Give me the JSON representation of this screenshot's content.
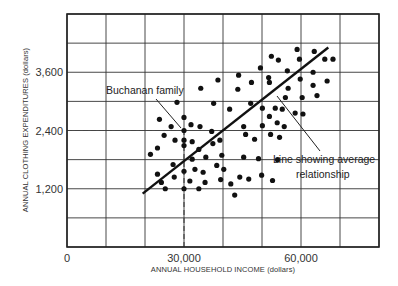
{
  "chart_data": {
    "type": "scatter",
    "title": "",
    "xlabel": "ANNUAL HOUSEHOLD INCOME (dollars)",
    "ylabel": "ANNUAL CLOTHING EXPENDITURES (dollars)",
    "xlim": [
      0,
      80000
    ],
    "ylim": [
      0,
      4800
    ],
    "grid": true,
    "x_gridlines": [
      0,
      10000,
      20000,
      30000,
      40000,
      50000,
      60000,
      70000,
      80000
    ],
    "y_gridlines": [
      0,
      600,
      1200,
      1800,
      2400,
      3000,
      3600,
      4200,
      4800
    ],
    "x_ticks": [
      {
        "value": 0,
        "label": "0"
      },
      {
        "value": 30000,
        "label": "30,000"
      },
      {
        "value": 60000,
        "label": "60,000"
      }
    ],
    "y_ticks": [
      {
        "value": 1200,
        "label": "1,200"
      },
      {
        "value": 2400,
        "label": "2,400"
      },
      {
        "value": 3600,
        "label": "3,600"
      }
    ],
    "series": [
      {
        "name": "Households",
        "points": [
          [
            59000,
            4070
          ],
          [
            63400,
            4030
          ],
          [
            52400,
            3930
          ],
          [
            54200,
            3850
          ],
          [
            59600,
            3870
          ],
          [
            66100,
            3870
          ],
          [
            68200,
            3870
          ],
          [
            49600,
            3690
          ],
          [
            56500,
            3630
          ],
          [
            63100,
            3600
          ],
          [
            44000,
            3540
          ],
          [
            51700,
            3490
          ],
          [
            38700,
            3440
          ],
          [
            47300,
            3390
          ],
          [
            51900,
            3390
          ],
          [
            59800,
            3460
          ],
          [
            66700,
            3420
          ],
          [
            34300,
            3270
          ],
          [
            43800,
            3250
          ],
          [
            56700,
            3270
          ],
          [
            63100,
            3330
          ],
          [
            64100,
            3120
          ],
          [
            56000,
            3080
          ],
          [
            60300,
            3080
          ],
          [
            37600,
            2960
          ],
          [
            47100,
            2960
          ],
          [
            41700,
            2840
          ],
          [
            50100,
            2860
          ],
          [
            53400,
            2860
          ],
          [
            55200,
            2840
          ],
          [
            58500,
            2760
          ],
          [
            60500,
            2740
          ],
          [
            51900,
            2690
          ],
          [
            53900,
            2560
          ],
          [
            55700,
            2480
          ],
          [
            45300,
            2480
          ],
          [
            50100,
            2500
          ],
          [
            34100,
            2480
          ],
          [
            45800,
            2320
          ],
          [
            52200,
            2320
          ],
          [
            54500,
            2260
          ],
          [
            37100,
            2380
          ],
          [
            39200,
            2200
          ],
          [
            48100,
            2220
          ],
          [
            28200,
            2980
          ],
          [
            30000,
            2670
          ],
          [
            23700,
            2630
          ],
          [
            31800,
            2520
          ],
          [
            26700,
            2480
          ],
          [
            30000,
            2400
          ],
          [
            24900,
            2300
          ],
          [
            27700,
            2200
          ],
          [
            30000,
            2090
          ],
          [
            32100,
            2170
          ],
          [
            23200,
            2040
          ],
          [
            30000,
            2200
          ],
          [
            33800,
            2010
          ],
          [
            37400,
            2130
          ],
          [
            32100,
            1810
          ],
          [
            27200,
            1700
          ],
          [
            30000,
            1560
          ],
          [
            32800,
            1600
          ],
          [
            34900,
            1540
          ],
          [
            38400,
            1680
          ],
          [
            40200,
            1600
          ],
          [
            23200,
            1500
          ],
          [
            24200,
            1330
          ],
          [
            27500,
            1440
          ],
          [
            31500,
            1360
          ],
          [
            35400,
            1330
          ],
          [
            39400,
            1390
          ],
          [
            44300,
            1440
          ],
          [
            30000,
            1200
          ],
          [
            33800,
            1200
          ],
          [
            25200,
            1200
          ],
          [
            21400,
            1910
          ],
          [
            39700,
            1890
          ],
          [
            35600,
            1850
          ],
          [
            45300,
            1850
          ],
          [
            42000,
            1300
          ],
          [
            43000,
            1070
          ],
          [
            46600,
            1400
          ],
          [
            49900,
            1480
          ],
          [
            52700,
            1370
          ],
          [
            54000,
            1800
          ],
          [
            49100,
            1820
          ]
        ]
      }
    ],
    "lines": [
      {
        "name": "Line showing average relationship",
        "from": [
          19400,
          1100
        ],
        "to": [
          67000,
          4110
        ]
      }
    ],
    "reference_lines": [
      {
        "name": "Buchanan income",
        "x": 30000,
        "y_from": 0,
        "y_to": 2400,
        "style": "dashed"
      },
      {
        "name": "Buchanan expenditure",
        "y": 2400,
        "x_from": 0,
        "x_to": 30000,
        "style": "dashed"
      }
    ],
    "annotations": [
      {
        "text": "Buchanan family",
        "points_to": [
          30000,
          2400
        ]
      },
      {
        "text": "Line showing average",
        "line2": "relationship",
        "points_to": [
          53300,
          3060
        ]
      }
    ]
  }
}
